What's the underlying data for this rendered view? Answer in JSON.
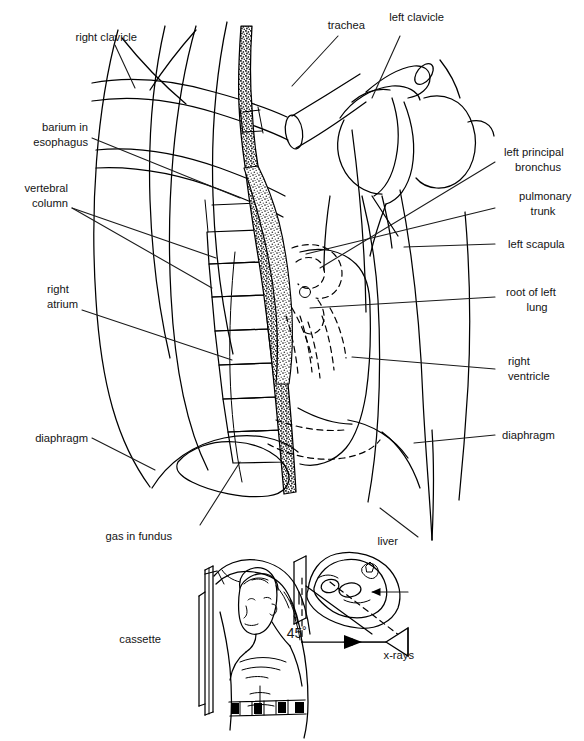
{
  "figure": {
    "width": 584,
    "height": 741,
    "background_color": "#ffffff",
    "line_color": "#000000",
    "text_color": "#141414"
  },
  "labels": {
    "right_clavicle": "right clavicle",
    "trachea": "trachea",
    "left_clavicle": "left clavicle",
    "barium_in_esophagus_line1": "barium in",
    "barium_in_esophagus_line2": "esophagus",
    "left_principal_bronchus_line1": "left principal",
    "left_principal_bronchus_line2": "bronchus",
    "vertebral_column_line1": "vertebral",
    "vertebral_column_line2": "column",
    "pulmonary_trunk_line1": "pulmonary",
    "pulmonary_trunk_line2": "trunk",
    "left_scapula": "left scapula",
    "right_atrium_line1": "right",
    "right_atrium_line2": "atrium",
    "root_of_left_lung_line1": "root of left",
    "root_of_left_lung_line2": "lung",
    "right_ventricle_line1": "right",
    "right_ventricle_line2": "ventricle",
    "diaphragm_left": "diaphragm",
    "diaphragm_right": "diaphragm",
    "gas_in_fundus": "gas in fundus",
    "liver": "liver",
    "cassette": "cassette",
    "angle": "45˚",
    "xrays": "x-rays"
  },
  "inset": {
    "description": "Patient positioning diagram: subject standing against cassette, x-ray beam at 45 degrees",
    "angle_value": "45˚",
    "beam_label": "x-rays",
    "film_label": "cassette"
  },
  "structures": [
    "right clavicle",
    "trachea",
    "left clavicle",
    "barium in esophagus",
    "left principal bronchus",
    "vertebral column",
    "pulmonary trunk",
    "left scapula",
    "right atrium",
    "root of left lung",
    "right ventricle",
    "diaphragm",
    "gas in fundus",
    "liver"
  ]
}
